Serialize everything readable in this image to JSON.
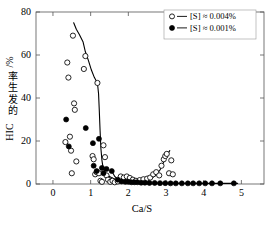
{
  "chart_data": {
    "type": "scatter",
    "title": "",
    "xlabel": "Ca/S",
    "ylabel": "HIC 的发生率 /%",
    "ylabel_prefix": "HIC",
    "ylabel_cjk": "的发生率",
    "ylabel_suffix": "/%",
    "xlim": [
      -0.45,
      5.6
    ],
    "ylim": [
      0,
      80
    ],
    "xticks": [
      0,
      1,
      2,
      3,
      4,
      5
    ],
    "xticklabels": [
      "0",
      "1",
      "2",
      "3",
      "4",
      "5"
    ],
    "yticks": [
      0,
      20,
      40,
      60,
      80
    ],
    "yticklabels": [
      "0",
      "20",
      "40",
      "60",
      "80"
    ],
    "grid": false,
    "frame": "box",
    "tick_direction": "in",
    "legend_position": "top-right",
    "legend": [
      {
        "marker": "open-circle",
        "label": "[S] ≈ 0.004%"
      },
      {
        "marker": "filled-circle",
        "label": "[S] ≈ 0.001%"
      }
    ],
    "series": [
      {
        "name": "[S] ≈ 0.004%",
        "marker": "open-circle",
        "color": "#000000",
        "points": [
          [
            0.33,
            19.5
          ],
          [
            0.38,
            56.5
          ],
          [
            0.41,
            49.5
          ],
          [
            0.45,
            22.0
          ],
          [
            0.48,
            15.5
          ],
          [
            0.5,
            5.0
          ],
          [
            0.53,
            69.0
          ],
          [
            0.56,
            37.5
          ],
          [
            0.58,
            34.5
          ],
          [
            0.62,
            10.5
          ],
          [
            0.82,
            53.5
          ],
          [
            0.86,
            59.5
          ],
          [
            1.05,
            13.0
          ],
          [
            1.08,
            11.5
          ],
          [
            1.12,
            4.5
          ],
          [
            1.16,
            5.5
          ],
          [
            1.18,
            47.0
          ],
          [
            1.22,
            5.0
          ],
          [
            1.26,
            1.5
          ],
          [
            1.3,
            1.0
          ],
          [
            1.34,
            18.0
          ],
          [
            1.38,
            12.5
          ],
          [
            1.42,
            4.0
          ],
          [
            1.46,
            2.0
          ],
          [
            1.52,
            1.0
          ],
          [
            1.58,
            1.5
          ],
          [
            1.64,
            0.8
          ],
          [
            1.72,
            1.2
          ],
          [
            1.8,
            3.5
          ],
          [
            1.88,
            3.0
          ],
          [
            1.96,
            3.5
          ],
          [
            2.04,
            2.8
          ],
          [
            2.12,
            2.0
          ],
          [
            2.2,
            1.5
          ],
          [
            2.3,
            1.8
          ],
          [
            2.4,
            2.2
          ],
          [
            2.5,
            2.5
          ],
          [
            2.58,
            3.0
          ],
          [
            2.66,
            4.5
          ],
          [
            2.74,
            5.5
          ],
          [
            2.82,
            4.0
          ],
          [
            2.88,
            8.5
          ],
          [
            2.94,
            11.5
          ],
          [
            2.98,
            13.0
          ],
          [
            3.02,
            14.0
          ],
          [
            3.08,
            5.0
          ],
          [
            3.14,
            11.0
          ],
          [
            3.18,
            4.5
          ]
        ]
      },
      {
        "name": "[S] ≈ 0.001%",
        "marker": "filled-circle",
        "color": "#000000",
        "points": [
          [
            0.35,
            30.0
          ],
          [
            0.42,
            17.5
          ],
          [
            0.87,
            26.0
          ],
          [
            1.06,
            19.0
          ],
          [
            1.08,
            8.5
          ],
          [
            1.16,
            6.0
          ],
          [
            1.22,
            21.0
          ],
          [
            1.3,
            7.5
          ],
          [
            1.34,
            5.0
          ],
          [
            1.42,
            7.0
          ],
          [
            1.56,
            6.0
          ],
          [
            1.72,
            2.0
          ],
          [
            1.82,
            1.2
          ],
          [
            1.92,
            1.0
          ],
          [
            2.0,
            1.0
          ],
          [
            2.08,
            0.8
          ],
          [
            2.16,
            0.8
          ],
          [
            2.24,
            0.8
          ],
          [
            2.34,
            0.6
          ],
          [
            2.44,
            0.6
          ],
          [
            2.56,
            0.5
          ],
          [
            2.7,
            0.5
          ],
          [
            2.84,
            0.4
          ],
          [
            2.98,
            0.4
          ],
          [
            3.12,
            0.3
          ],
          [
            3.26,
            0.3
          ],
          [
            3.42,
            0.3
          ],
          [
            3.58,
            0.3
          ],
          [
            3.72,
            0.3
          ],
          [
            3.88,
            0.3
          ],
          [
            4.04,
            0.3
          ],
          [
            4.22,
            0.3
          ],
          [
            4.44,
            0.3
          ],
          [
            4.8,
            0.3
          ]
        ]
      }
    ],
    "curves": [
      {
        "name": "trend-line-upper",
        "points": [
          [
            0.55,
            75.0
          ],
          [
            0.62,
            72.0
          ],
          [
            0.7,
            69.5
          ],
          [
            0.8,
            66.0
          ],
          [
            0.86,
            61.5
          ],
          [
            0.94,
            57.5
          ],
          [
            1.02,
            53.0
          ],
          [
            1.1,
            49.5
          ],
          [
            1.18,
            47.0
          ],
          [
            1.21,
            42.0
          ],
          [
            1.23,
            34.0
          ],
          [
            1.25,
            25.0
          ],
          [
            1.27,
            17.0
          ],
          [
            1.3,
            11.0
          ],
          [
            1.33,
            7.5
          ],
          [
            1.38,
            5.5
          ],
          [
            1.45,
            4.0
          ],
          [
            1.55,
            3.0
          ],
          [
            1.65,
            2.2
          ],
          [
            1.78,
            1.8
          ],
          [
            1.92,
            1.5
          ],
          [
            2.05,
            1.3
          ],
          [
            2.2,
            1.3
          ],
          [
            2.35,
            1.5
          ],
          [
            2.5,
            2.0
          ],
          [
            2.62,
            2.8
          ],
          [
            2.74,
            4.2
          ],
          [
            2.84,
            6.5
          ],
          [
            2.92,
            9.5
          ],
          [
            2.98,
            12.0
          ],
          [
            3.04,
            14.0
          ],
          [
            3.1,
            15.5
          ]
        ]
      },
      {
        "name": "trend-line-lower",
        "points": [
          [
            1.56,
            6.0
          ],
          [
            1.64,
            3.5
          ],
          [
            1.72,
            2.0
          ],
          [
            1.82,
            1.2
          ],
          [
            1.95,
            0.9
          ],
          [
            2.1,
            0.8
          ],
          [
            2.3,
            0.6
          ],
          [
            2.6,
            0.5
          ],
          [
            3.0,
            0.4
          ],
          [
            3.5,
            0.3
          ],
          [
            4.0,
            0.3
          ],
          [
            4.5,
            0.3
          ],
          [
            4.9,
            0.3
          ]
        ]
      }
    ]
  }
}
